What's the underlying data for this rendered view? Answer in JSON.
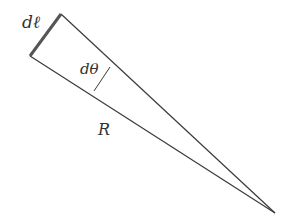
{
  "diagram": {
    "labels": {
      "arc_length": "dℓ",
      "angle": "dθ",
      "radius": "R"
    },
    "colors": {
      "line": "#3a3a3a",
      "arc": "#555555"
    }
  }
}
